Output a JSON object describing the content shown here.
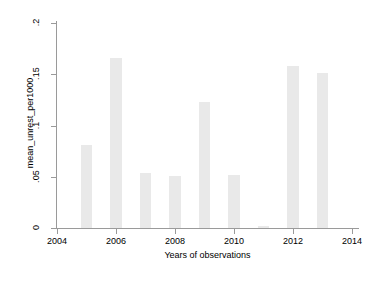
{
  "chart_data": {
    "type": "bar",
    "title": "",
    "subtitle": "",
    "xlabel": "Years of observations",
    "ylabel": "mean_unrest_per1000",
    "categories": [
      2005,
      2006,
      2007,
      2008,
      2009,
      2010,
      2011,
      2012,
      2013
    ],
    "values": [
      0.081,
      0.166,
      0.054,
      0.051,
      0.123,
      0.052,
      0.002,
      0.158,
      0.151
    ],
    "series": [
      {
        "name": "mean_unrest_per1000",
        "values": [
          0.081,
          0.166,
          0.054,
          0.051,
          0.123,
          0.052,
          0.002,
          0.158,
          0.151
        ]
      }
    ],
    "xlim": [
      2004,
      2014
    ],
    "ylim": [
      0,
      0.2
    ],
    "x_ticks": [
      2004,
      2006,
      2008,
      2010,
      2012,
      2014
    ],
    "x_tick_labels": [
      "2004",
      "2006",
      "2008",
      "2010",
      "2012",
      "2014"
    ],
    "y_ticks": [
      0,
      0.05,
      0.1,
      0.15,
      0.2
    ],
    "y_tick_labels": [
      "0",
      ".05",
      ".1",
      ".15",
      ".2"
    ],
    "grid": false,
    "legend": false,
    "legend_position": "none",
    "bar_color": "#e9e9e9",
    "axis_color": "#9a9a9a",
    "background_color": "#ffffff",
    "bar_width_years": 0.39
  },
  "axes": {
    "y_title": "mean_unrest_per1000",
    "x_title": "Years of observations"
  }
}
